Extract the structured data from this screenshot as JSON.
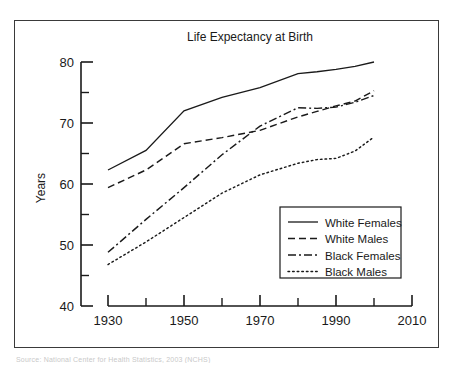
{
  "figure": {
    "caption": "Source: National Center for Health Statistics, 2003 (NCHS)"
  },
  "chart_data": {
    "type": "line",
    "title": "Life Expectancy at Birth",
    "xlabel": "",
    "ylabel": "Years",
    "xlim": [
      1930,
      2010
    ],
    "ylim": [
      40,
      80
    ],
    "xticks": [
      1930,
      1950,
      1970,
      1990,
      2010
    ],
    "xtick_labels": [
      "1930",
      "1950",
      "1970",
      "1990",
      "2010"
    ],
    "xminor": [
      1940,
      1960,
      1980,
      2000
    ],
    "yticks": [
      40,
      50,
      60,
      70,
      80
    ],
    "ytick_labels": [
      "40",
      "50",
      "60",
      "70",
      "80"
    ],
    "yminor": [
      45,
      55,
      65,
      75
    ],
    "grid": false,
    "legend_position": "lower right",
    "x": [
      1930,
      1940,
      1950,
      1960,
      1970,
      1980,
      1985,
      1990,
      1995,
      2000
    ],
    "series": [
      {
        "name": "White Females",
        "style": "solid",
        "color": "#1a1a1a",
        "values": [
          62.3,
          65.5,
          72.0,
          74.2,
          75.8,
          78.1,
          78.4,
          78.8,
          79.3,
          80.0
        ]
      },
      {
        "name": "White Males",
        "style": "dashed",
        "color": "#1a1a1a",
        "values": [
          59.4,
          62.3,
          66.6,
          67.6,
          68.8,
          71.0,
          71.9,
          72.8,
          73.6,
          75.3
        ]
      },
      {
        "name": "Black Females",
        "style": "dashdot",
        "color": "#1a1a1a",
        "values": [
          48.8,
          54.2,
          59.4,
          64.8,
          69.5,
          72.5,
          72.4,
          72.6,
          73.4,
          74.5
        ]
      },
      {
        "name": "Black Males",
        "style": "dotted",
        "color": "#1a1a1a",
        "values": [
          46.8,
          50.5,
          54.5,
          58.5,
          61.5,
          63.4,
          64.0,
          64.2,
          65.4,
          67.7
        ]
      }
    ],
    "legend": [
      {
        "label": "White Females",
        "style": "solid"
      },
      {
        "label": "White Males",
        "style": "dashed"
      },
      {
        "label": "Black Females",
        "style": "dashdot"
      },
      {
        "label": "Black Males",
        "style": "dotted"
      }
    ]
  }
}
